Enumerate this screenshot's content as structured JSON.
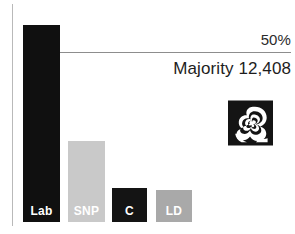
{
  "chart_data": {
    "type": "bar",
    "title": "",
    "subtitle": "",
    "xlabel": "",
    "ylabel": "",
    "categories": [
      "Lab",
      "SNP",
      "C",
      "LD"
    ],
    "values": [
      53.2,
      18.3,
      7.7,
      7.2
    ],
    "ylim": [
      0,
      60
    ],
    "grid": false,
    "legend": null,
    "bar_colors": [
      "#101010",
      "#c9c9c9",
      "#141414",
      "#a9a9a9"
    ],
    "bar_label_color": "#ffffff",
    "annotations": [
      {
        "name": "threshold",
        "label": "50%",
        "value": 50,
        "type": "horizontal-line"
      },
      {
        "name": "majority",
        "label": "Majority 12,408"
      }
    ],
    "series": [
      {
        "name": "Vote share",
        "points": [
          {
            "category": "Lab",
            "value": 53.2
          },
          {
            "category": "SNP",
            "value": 18.3
          },
          {
            "category": "C",
            "value": 7.7
          },
          {
            "category": "LD",
            "value": 7.2
          }
        ]
      }
    ]
  },
  "axis": {
    "line_color": "#b9b9b9"
  },
  "threshold": {
    "label": "50%",
    "line_color": "#8d8d8d"
  },
  "majority": {
    "label": "Majority 12,408"
  },
  "emblem": {
    "name": "labour-rose-emblem",
    "background": "#141414",
    "rose_color": "#ffffff"
  },
  "bars": [
    {
      "key": "lab",
      "label": "Lab",
      "color": "#101010",
      "texture": "solid",
      "left": 23,
      "width": 37,
      "height": 197
    },
    {
      "key": "snp",
      "label": "SNP",
      "color": "#c9c9c9",
      "texture": "halftone",
      "left": 68,
      "width": 37,
      "height": 81
    },
    {
      "key": "con",
      "label": "C",
      "color": "#141414",
      "texture": "solid",
      "left": 112,
      "width": 35,
      "height": 34
    },
    {
      "key": "ld",
      "label": "LD",
      "color": "#a9a9a9",
      "texture": "solid",
      "left": 156,
      "width": 36,
      "height": 32
    }
  ]
}
